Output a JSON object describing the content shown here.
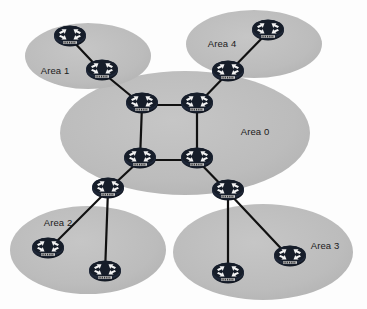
{
  "diagram": {
    "canvas": {
      "width": 367,
      "height": 309
    },
    "background_color": "#fdfdfd",
    "palette": {
      "area_fill": "#b9b9b9",
      "area_fill_light": "#c2c2c2",
      "router_body": "#1c2433",
      "router_arrow": "#f2f2f2",
      "link_color": "#111111",
      "label_color": "#1b1b1b"
    }
  },
  "areas": [
    {
      "id": "area0",
      "label": "Area 0",
      "cx": 185,
      "cy": 133,
      "rx": 125,
      "ry": 62,
      "label_x": 255,
      "label_y": 131
    },
    {
      "id": "area1",
      "label": "Area 1",
      "cx": 88,
      "cy": 56,
      "rx": 63,
      "ry": 33,
      "label_x": 55,
      "label_y": 70
    },
    {
      "id": "area4",
      "label": "Area 4",
      "cx": 254,
      "cy": 44,
      "rx": 68,
      "ry": 34,
      "label_x": 222,
      "label_y": 43
    },
    {
      "id": "area2",
      "label": "Area 2",
      "cx": 88,
      "cy": 250,
      "rx": 78,
      "ry": 44,
      "label_x": 58,
      "label_y": 222
    },
    {
      "id": "area3",
      "label": "Area 3",
      "cx": 263,
      "cy": 252,
      "rx": 90,
      "ry": 48,
      "label_x": 325,
      "label_y": 245
    }
  ],
  "routers": [
    {
      "id": "r-a1-internal",
      "name": "router-area1-internal",
      "caption": "ROUTER",
      "x": 70,
      "y": 38,
      "area": "area1"
    },
    {
      "id": "r-a1-abr",
      "name": "router-area1-abr",
      "caption": "ROUTER",
      "x": 102,
      "y": 72,
      "area": "area1"
    },
    {
      "id": "r-a4-internal",
      "name": "router-area4-internal",
      "caption": "ROUTER",
      "x": 268,
      "y": 32,
      "area": "area4"
    },
    {
      "id": "r-a4-abr",
      "name": "router-area4-abr",
      "caption": "ROUTER",
      "x": 228,
      "y": 73,
      "area": "area4"
    },
    {
      "id": "r-a0-tl",
      "name": "router-backbone-top-left",
      "caption": "ROUTER",
      "x": 142,
      "y": 105,
      "area": "area0"
    },
    {
      "id": "r-a0-tr",
      "name": "router-backbone-top-right",
      "caption": "ROUTER",
      "x": 197,
      "y": 105,
      "area": "area0"
    },
    {
      "id": "r-a0-bl",
      "name": "router-backbone-bottom-left",
      "caption": "ROUTER",
      "x": 140,
      "y": 160,
      "area": "area0"
    },
    {
      "id": "r-a0-br",
      "name": "router-backbone-bottom-right",
      "caption": "ROUTER",
      "x": 197,
      "y": 160,
      "area": "area0"
    },
    {
      "id": "r-a2-abr",
      "name": "router-area2-abr",
      "caption": "ROUTER",
      "x": 108,
      "y": 190,
      "area": "area2"
    },
    {
      "id": "r-a2-int1",
      "name": "router-area2-internal-1",
      "caption": "ROUTER",
      "x": 48,
      "y": 250,
      "area": "area2"
    },
    {
      "id": "r-a2-int2",
      "name": "router-area2-internal-2",
      "caption": "ROUTER",
      "x": 105,
      "y": 273,
      "area": "area2"
    },
    {
      "id": "r-a3-abr",
      "name": "router-area3-abr",
      "caption": "ROUTER",
      "x": 228,
      "y": 192,
      "area": "area3"
    },
    {
      "id": "r-a3-int1",
      "name": "router-area3-internal-1",
      "caption": "ROUTER",
      "x": 228,
      "y": 275,
      "area": "area3"
    },
    {
      "id": "r-a3-int2",
      "name": "router-area3-internal-2",
      "caption": "ROUTER",
      "x": 290,
      "y": 258,
      "area": "area3"
    }
  ],
  "links": [
    {
      "from": "r-a1-internal",
      "to": "r-a1-abr"
    },
    {
      "from": "r-a1-abr",
      "to": "r-a0-tl"
    },
    {
      "from": "r-a0-tl",
      "to": "r-a0-tr"
    },
    {
      "from": "r-a0-tr",
      "to": "r-a4-abr"
    },
    {
      "from": "r-a4-abr",
      "to": "r-a4-internal"
    },
    {
      "from": "r-a0-tl",
      "to": "r-a0-bl"
    },
    {
      "from": "r-a0-tr",
      "to": "r-a0-br"
    },
    {
      "from": "r-a0-bl",
      "to": "r-a0-br"
    },
    {
      "from": "r-a0-bl",
      "to": "r-a2-abr"
    },
    {
      "from": "r-a2-abr",
      "to": "r-a2-int1"
    },
    {
      "from": "r-a2-abr",
      "to": "r-a2-int2"
    },
    {
      "from": "r-a0-br",
      "to": "r-a3-abr"
    },
    {
      "from": "r-a3-abr",
      "to": "r-a3-int1"
    },
    {
      "from": "r-a3-abr",
      "to": "r-a3-int2"
    }
  ]
}
